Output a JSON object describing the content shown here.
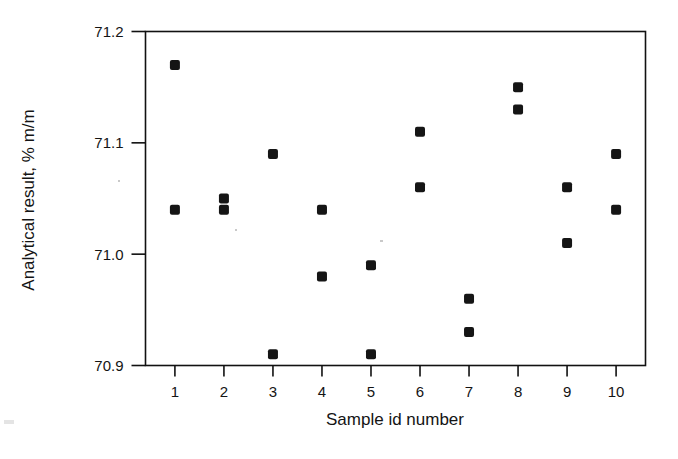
{
  "chart_data": {
    "type": "scatter",
    "title": "",
    "xlabel": "Sample id number",
    "ylabel": "Analytical result, % m/m",
    "categories": [
      1,
      2,
      3,
      4,
      5,
      6,
      7,
      8,
      9,
      10
    ],
    "xtick_labels": [
      "1",
      "2",
      "3",
      "4",
      "5",
      "6",
      "7",
      "8",
      "9",
      "10"
    ],
    "ytick_labels": [
      "70.9",
      "71.0",
      "71.1",
      "71.2"
    ],
    "yticks": [
      70.9,
      71.0,
      71.1,
      71.2
    ],
    "ylim": [
      70.9,
      71.2
    ],
    "xlim": [
      0.4,
      10.6
    ],
    "grid": false,
    "legend": null,
    "marker": "square",
    "marker_color": "#151515",
    "series": [
      {
        "name": "Replicate 1",
        "values": [
          71.17,
          71.05,
          71.09,
          71.04,
          70.99,
          71.11,
          70.96,
          71.15,
          71.06,
          71.09
        ]
      },
      {
        "name": "Replicate 2",
        "values": [
          71.04,
          71.04,
          70.91,
          70.98,
          70.91,
          71.06,
          70.93,
          71.13,
          71.01,
          71.04
        ]
      }
    ],
    "points": [
      {
        "x": 1,
        "y": 71.17
      },
      {
        "x": 1,
        "y": 71.04
      },
      {
        "x": 2,
        "y": 71.05
      },
      {
        "x": 2,
        "y": 71.04
      },
      {
        "x": 3,
        "y": 71.09
      },
      {
        "x": 3,
        "y": 70.91
      },
      {
        "x": 4,
        "y": 71.04
      },
      {
        "x": 4,
        "y": 70.98
      },
      {
        "x": 5,
        "y": 70.99
      },
      {
        "x": 5,
        "y": 70.91
      },
      {
        "x": 6,
        "y": 71.11
      },
      {
        "x": 6,
        "y": 71.06
      },
      {
        "x": 7,
        "y": 70.96
      },
      {
        "x": 7,
        "y": 70.93
      },
      {
        "x": 8,
        "y": 71.15
      },
      {
        "x": 8,
        "y": 71.13
      },
      {
        "x": 9,
        "y": 71.06
      },
      {
        "x": 9,
        "y": 71.01
      },
      {
        "x": 10,
        "y": 71.09
      },
      {
        "x": 10,
        "y": 71.04
      }
    ]
  },
  "colors": {
    "marker": "#151515",
    "axis": "#111111",
    "text": "#141414",
    "background": "#ffffff"
  }
}
